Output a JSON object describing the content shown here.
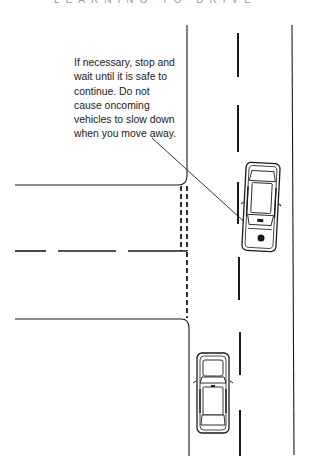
{
  "header": {
    "title": "LEARNING TO DRIVE"
  },
  "diagram": {
    "caption_lines": [
      "If necessary, stop and",
      "wait until it is safe to",
      "continue. Do not",
      "cause oncoming",
      "vehicles to slow down",
      "when you move away."
    ],
    "elements": {
      "main_road": "vertical two-lane road",
      "side_road": "junction on left with give-way markings",
      "parked_car": "car at kerb pulling away",
      "oncoming_car": "approaching car in lane",
      "driver_marker": "driver position dot"
    },
    "colors": {
      "line": "#1a1a1a",
      "background": "#ffffff"
    }
  }
}
